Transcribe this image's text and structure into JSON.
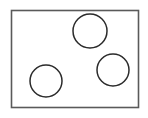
{
  "figure": {
    "name": "rectangle-with-three-circles",
    "canvas": {
      "width": 148,
      "height": 118,
      "background_color": "#ffffff"
    },
    "shapes": {
      "rectangle": {
        "label": "bounding-rectangle",
        "x": 11.5,
        "y": 10.5,
        "width": 127,
        "height": 97,
        "stroke_color": "#5a5a5a",
        "stroke_width": 1.6,
        "fill": "none"
      },
      "circles": [
        {
          "label": "circle-top",
          "cx": 90,
          "cy": 31,
          "r": 17,
          "stroke_color": "#2b2b2b",
          "stroke_width": 1.5,
          "fill": "none"
        },
        {
          "label": "circle-bottom-left",
          "cx": 46,
          "cy": 81,
          "r": 16,
          "stroke_color": "#2b2b2b",
          "stroke_width": 1.5,
          "fill": "none"
        },
        {
          "label": "circle-right",
          "cx": 113,
          "cy": 70,
          "r": 16,
          "stroke_color": "#2b2b2b",
          "stroke_width": 1.5,
          "fill": "none"
        }
      ]
    }
  }
}
